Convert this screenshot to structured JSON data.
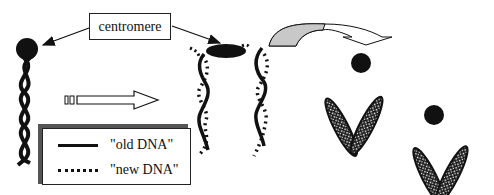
{
  "diagram": {
    "centromere_label": "centromere",
    "legend": {
      "items": [
        {
          "label": "\"old DNA\"",
          "style": "solid"
        },
        {
          "label": "\"new DNA\"",
          "style": "dotted"
        }
      ]
    },
    "colors": {
      "ink": "#111111",
      "curved_arrow_fill": "#c8c8c8",
      "legend_shadow": "#555555",
      "background": "#ffffff"
    },
    "stages": [
      {
        "name": "single chromatid helix",
        "strands": "old DNA"
      },
      {
        "name": "replicated helices joined at centromere",
        "strands": "old + new DNA"
      },
      {
        "name": "two condensed chromosomes (X-like arms)",
        "count": 2
      }
    ]
  }
}
